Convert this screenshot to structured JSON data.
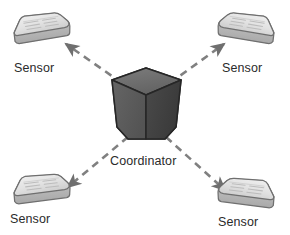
{
  "diagram": {
    "background_color": "#ffffff",
    "center_node": {
      "label": "Coordinator",
      "icon": "cube-icon",
      "shape": "pentagon-cube",
      "top_face_color": "#6e6e6e",
      "left_face_color": "#5a5a5a",
      "right_face_color": "#3f3f3f",
      "outline_color": "#2a2a2a",
      "label_x": 145,
      "label_y": 161,
      "center_x": 146,
      "center_y": 104
    },
    "sensor_nodes": [
      {
        "id": "sensor-top-left",
        "label": "Sensor",
        "icon": "sensor-node-icon",
        "x": 41,
        "y": 31,
        "flip": false,
        "label_x": 40,
        "label_y": 68
      },
      {
        "id": "sensor-top-right",
        "label": "Sensor",
        "icon": "sensor-node-icon",
        "x": 247,
        "y": 31,
        "flip": true,
        "label_x": 248,
        "label_y": 68
      },
      {
        "id": "sensor-bottom-left",
        "label": "Sensor",
        "icon": "sensor-node-icon",
        "x": 41,
        "y": 192,
        "flip": false,
        "label_x": 36,
        "label_y": 219
      },
      {
        "id": "sensor-bottom-right",
        "label": "Sensor",
        "icon": "sensor-node-icon",
        "x": 247,
        "y": 196,
        "flip": true,
        "label_x": 246,
        "label_y": 222
      }
    ],
    "sensor_style": {
      "body_color": "#d8d8d8",
      "top_color": "#e9e9e9",
      "side_color": "#b9b9b9",
      "outline_color": "#6d6d6d",
      "pattern_color": "#bdbdbd"
    },
    "links": [
      {
        "id": "link-top-left",
        "from": "coordinator",
        "to": "sensor-top-left",
        "style": "dashed",
        "arrows": "both",
        "color": "#808080"
      },
      {
        "id": "link-top-right",
        "from": "coordinator",
        "to": "sensor-top-right",
        "style": "dashed",
        "arrows": "both",
        "color": "#808080"
      },
      {
        "id": "link-bottom-left",
        "from": "coordinator",
        "to": "sensor-bottom-left",
        "style": "dashed",
        "arrows": "both",
        "color": "#808080"
      },
      {
        "id": "link-bottom-right",
        "from": "coordinator",
        "to": "sensor-bottom-right",
        "style": "dashed",
        "arrows": "both",
        "color": "#808080"
      }
    ]
  }
}
